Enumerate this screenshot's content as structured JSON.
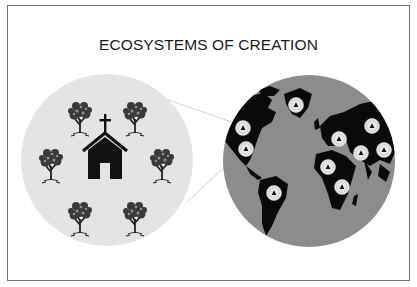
{
  "title": "ECOSYSTEMS OF CREATION",
  "colors": {
    "frame": "#6f6f6f",
    "left_circle": "#e4e4e4",
    "right_circle": "#8c8c8c",
    "land": "#0a0a0a",
    "marker_fill": "#e8e8e8",
    "ink": "#111111"
  },
  "left_panel": {
    "label": "local-ecosystem",
    "center_icon": "church-icon",
    "trees": [
      {
        "id": "tree-top-left",
        "x": 80,
        "y": 104
      },
      {
        "id": "tree-top-right",
        "x": 135,
        "y": 104
      },
      {
        "id": "tree-mid-left",
        "x": 51,
        "y": 152
      },
      {
        "id": "tree-mid-right",
        "x": 162,
        "y": 152
      },
      {
        "id": "tree-bottom-left",
        "x": 80,
        "y": 205
      },
      {
        "id": "tree-bottom-right",
        "x": 135,
        "y": 205
      }
    ]
  },
  "right_panel": {
    "label": "global-ecosystem",
    "icon": "world-map-icon",
    "markers": [
      {
        "id": "marker-greenland",
        "x": 296,
        "y": 105
      },
      {
        "id": "marker-nw-america",
        "x": 243,
        "y": 128
      },
      {
        "id": "marker-n-america",
        "x": 246,
        "y": 149
      },
      {
        "id": "marker-europe",
        "x": 339,
        "y": 139
      },
      {
        "id": "marker-russia",
        "x": 372,
        "y": 126
      },
      {
        "id": "marker-mideast",
        "x": 361,
        "y": 153
      },
      {
        "id": "marker-asia",
        "x": 384,
        "y": 150
      },
      {
        "id": "marker-w-africa",
        "x": 328,
        "y": 167
      },
      {
        "id": "marker-e-africa",
        "x": 342,
        "y": 187
      },
      {
        "id": "marker-s-america",
        "x": 274,
        "y": 193
      }
    ]
  }
}
